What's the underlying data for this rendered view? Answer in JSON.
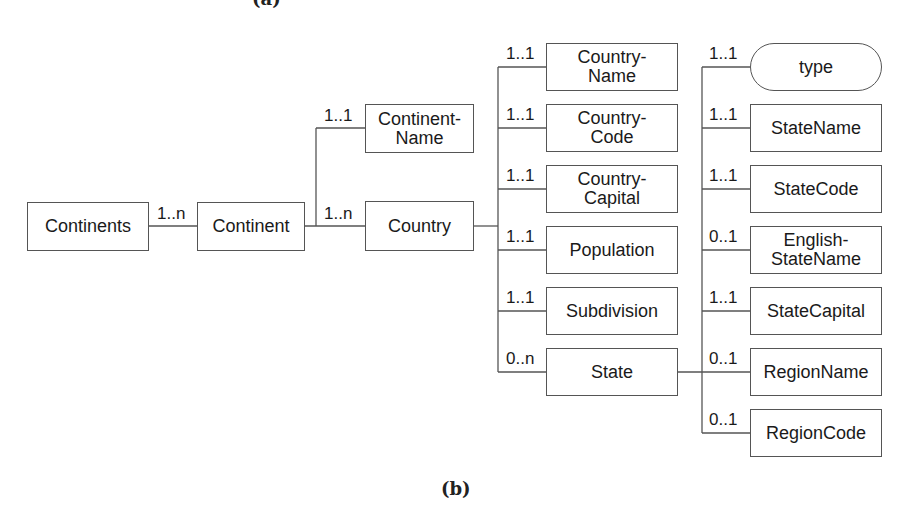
{
  "captions": {
    "top_partial": "(a)",
    "bottom": "(b)"
  },
  "colors": {
    "line": "#555555",
    "text": "#1a1a1a",
    "background": "#ffffff"
  },
  "nodes": {
    "continents": {
      "label": "Continents"
    },
    "continent": {
      "label": "Continent"
    },
    "continent_name": {
      "label": "Continent-\nName"
    },
    "country": {
      "label": "Country"
    },
    "country_name": {
      "label": "Country-\nName"
    },
    "country_code": {
      "label": "Country-\nCode"
    },
    "country_capital": {
      "label": "Country-\nCapital"
    },
    "population": {
      "label": "Population"
    },
    "subdivision": {
      "label": "Subdivision"
    },
    "state": {
      "label": "State"
    },
    "type": {
      "label": "type"
    },
    "state_name": {
      "label": "StateName"
    },
    "state_code": {
      "label": "StateCode"
    },
    "english_state_name": {
      "label": "English-\nStateName"
    },
    "state_capital": {
      "label": "StateCapital"
    },
    "region_name": {
      "label": "RegionName"
    },
    "region_code": {
      "label": "RegionCode"
    }
  },
  "edges": [
    {
      "from": "Continents",
      "to": "Continent",
      "cardinality": "1..n"
    },
    {
      "from": "Continent",
      "to": "Continent-Name",
      "cardinality": "1..1"
    },
    {
      "from": "Continent",
      "to": "Country",
      "cardinality": "1..n"
    },
    {
      "from": "Country",
      "to": "Country-Name",
      "cardinality": "1..1"
    },
    {
      "from": "Country",
      "to": "Country-Code",
      "cardinality": "1..1"
    },
    {
      "from": "Country",
      "to": "Country-Capital",
      "cardinality": "1..1"
    },
    {
      "from": "Country",
      "to": "Population",
      "cardinality": "1..1"
    },
    {
      "from": "Country",
      "to": "Subdivision",
      "cardinality": "1..1"
    },
    {
      "from": "Country",
      "to": "State",
      "cardinality": "0..n"
    },
    {
      "from": "State",
      "to": "type",
      "cardinality": "1..1"
    },
    {
      "from": "State",
      "to": "StateName",
      "cardinality": "1..1"
    },
    {
      "from": "State",
      "to": "StateCode",
      "cardinality": "1..1"
    },
    {
      "from": "State",
      "to": "English-StateName",
      "cardinality": "0..1"
    },
    {
      "from": "State",
      "to": "StateCapital",
      "cardinality": "1..1"
    },
    {
      "from": "State",
      "to": "RegionName",
      "cardinality": "0..1"
    },
    {
      "from": "State",
      "to": "RegionCode",
      "cardinality": "0..1"
    }
  ]
}
